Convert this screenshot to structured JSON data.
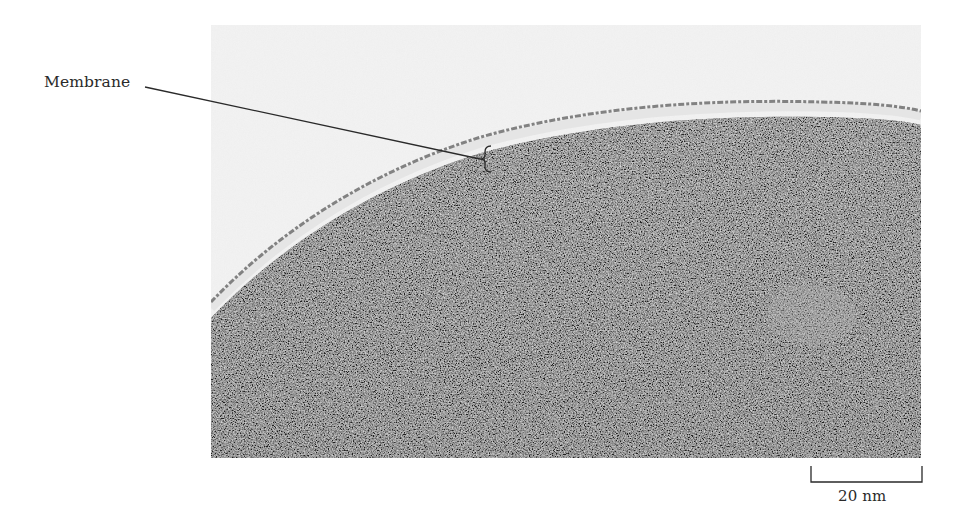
{
  "figure": {
    "labels": {
      "membrane": "Membrane"
    },
    "scale_bar": {
      "label": "20 nm",
      "length_px": 111
    },
    "colors": {
      "background": "#ffffff",
      "exterior": "#f0f0f0",
      "membrane_dark_line": "#6a6a6a",
      "membrane_light_band": "#e2e2e2",
      "cytoplasm": "#8c8c8c",
      "annotation": "#2a2a2a"
    }
  }
}
